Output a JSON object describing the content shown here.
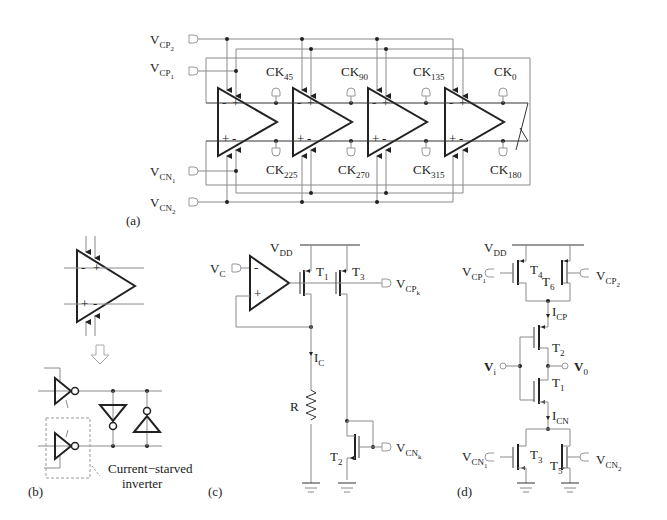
{
  "figure": {
    "panels": [
      {
        "id": "a",
        "label": "(a)"
      },
      {
        "id": "b",
        "label": "(b)"
      },
      {
        "id": "c",
        "label": "(c)"
      },
      {
        "id": "d",
        "label": "(d)"
      }
    ]
  },
  "panel_a": {
    "inputs": {
      "vcp2": {
        "main": "V",
        "sub": "CP",
        "subsub": "2"
      },
      "vcp1": {
        "main": "V",
        "sub": "CP",
        "subsub": "1"
      },
      "vcn1": {
        "main": "V",
        "sub": "CN",
        "subsub": "1"
      },
      "vcn2": {
        "main": "V",
        "sub": "CN",
        "subsub": "2"
      }
    },
    "clocks_top": [
      {
        "main": "CK",
        "sub": "45"
      },
      {
        "main": "CK",
        "sub": "90"
      },
      {
        "main": "CK",
        "sub": "135"
      },
      {
        "main": "CK",
        "sub": "0"
      }
    ],
    "clocks_bottom": [
      {
        "main": "CK",
        "sub": "225"
      },
      {
        "main": "CK",
        "sub": "270"
      },
      {
        "main": "CK",
        "sub": "315"
      },
      {
        "main": "CK",
        "sub": "180"
      }
    ],
    "stage_count": 4,
    "top_pins": [
      "-",
      "+"
    ],
    "bottom_pins": [
      "+",
      "-"
    ]
  },
  "panel_b": {
    "top_pins": [
      "-",
      "+"
    ],
    "bottom_pins": [
      "+",
      "-"
    ],
    "annotation": {
      "line1": "Current−starved",
      "line2": "inverter"
    }
  },
  "panel_c": {
    "vdd": {
      "main": "V",
      "sub": "DD"
    },
    "vc": {
      "main": "V",
      "sub": "C"
    },
    "opamp_pins": [
      "-",
      "+"
    ],
    "t1": {
      "main": "T",
      "sub": "1"
    },
    "t3": {
      "main": "T",
      "sub": "3"
    },
    "t2": {
      "main": "T",
      "sub": "2"
    },
    "vcpk": {
      "main": "V",
      "sub": "CP",
      "subsub": "k"
    },
    "vcnk": {
      "main": "V",
      "sub": "CN",
      "subsub": "k"
    },
    "ic": {
      "main": "I",
      "sub": "C"
    },
    "r": "R"
  },
  "panel_d": {
    "vdd": {
      "main": "V",
      "sub": "DD"
    },
    "vcp1": {
      "main": "V",
      "sub": "CP",
      "subsub": "1"
    },
    "vcp2": {
      "main": "V",
      "sub": "CP",
      "subsub": "2"
    },
    "vcn1": {
      "main": "V",
      "sub": "CN",
      "subsub": "1"
    },
    "vcn2": {
      "main": "V",
      "sub": "CN",
      "subsub": "2"
    },
    "t4": {
      "main": "T",
      "sub": "4"
    },
    "t6": {
      "main": "T",
      "sub": "6"
    },
    "t2": {
      "main": "T",
      "sub": "2"
    },
    "t1": {
      "main": "T",
      "sub": "1"
    },
    "t3": {
      "main": "T",
      "sub": "3"
    },
    "t5": {
      "main": "T",
      "sub": "5"
    },
    "icp": {
      "main": "I",
      "sub": "CP"
    },
    "icn": {
      "main": "I",
      "sub": "CN"
    },
    "vi": {
      "main": "V",
      "sub": "i"
    },
    "vo": {
      "main": "V",
      "sub": "0"
    }
  }
}
